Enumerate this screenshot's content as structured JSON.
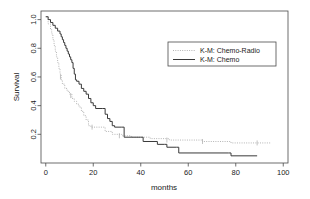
{
  "chart_data": {
    "type": "line",
    "title": "",
    "subtitle": "",
    "xlabel": "months",
    "ylabel": "Survival",
    "xlim": [
      -2,
      102
    ],
    "ylim": [
      0.0,
      1.06
    ],
    "grid": false,
    "legend_position": "upper-right",
    "xticks": [
      0,
      20,
      40,
      60,
      80,
      100
    ],
    "xtick_labels": [
      "0",
      "20",
      "40",
      "60",
      "80",
      "100"
    ],
    "yticks": [
      0.2,
      0.4,
      0.6,
      0.8,
      1.0
    ],
    "ytick_labels": [
      "0.2",
      "0.4",
      "0.6",
      "0.8",
      "1.0"
    ],
    "series": [
      {
        "name": "K-M: Chemo-Radio",
        "style": "dotted",
        "color": "#b4b4b4",
        "steps": [
          [
            0,
            1.02
          ],
          [
            1,
            0.97
          ],
          [
            2,
            0.93
          ],
          [
            2.5,
            0.9
          ],
          [
            3,
            0.86
          ],
          [
            3.5,
            0.82
          ],
          [
            4,
            0.78
          ],
          [
            4.5,
            0.74
          ],
          [
            5,
            0.7
          ],
          [
            5.5,
            0.66
          ],
          [
            6,
            0.62
          ],
          [
            6.5,
            0.58
          ],
          [
            7,
            0.55
          ],
          [
            8,
            0.52
          ],
          [
            9,
            0.5
          ],
          [
            10,
            0.48
          ],
          [
            11,
            0.45
          ],
          [
            12,
            0.43
          ],
          [
            13,
            0.41
          ],
          [
            14,
            0.39
          ],
          [
            15,
            0.36
          ],
          [
            16,
            0.33
          ],
          [
            17,
            0.3
          ],
          [
            18,
            0.26
          ],
          [
            19,
            0.25
          ],
          [
            22,
            0.25
          ],
          [
            25,
            0.22
          ],
          [
            28,
            0.2
          ],
          [
            32,
            0.19
          ],
          [
            36,
            0.18
          ],
          [
            40,
            0.18
          ],
          [
            44,
            0.17
          ],
          [
            48,
            0.17
          ],
          [
            52,
            0.16
          ],
          [
            58,
            0.16
          ],
          [
            66,
            0.15
          ],
          [
            78,
            0.14
          ],
          [
            90,
            0.14
          ],
          [
            95,
            0.14
          ]
        ],
        "censor_points": [
          [
            6.2,
            0.6
          ],
          [
            10.5,
            0.47
          ],
          [
            19.5,
            0.25
          ],
          [
            31,
            0.19
          ],
          [
            51,
            0.16
          ],
          [
            66,
            0.15
          ],
          [
            89,
            0.14
          ]
        ]
      },
      {
        "name": "K-M: Chemo",
        "style": "solid",
        "color": "#3a3a3a",
        "steps": [
          [
            0,
            1.02
          ],
          [
            1,
            1.0
          ],
          [
            2,
            0.98
          ],
          [
            3,
            0.96
          ],
          [
            4,
            0.94
          ],
          [
            5,
            0.92
          ],
          [
            6,
            0.9
          ],
          [
            6.5,
            0.88
          ],
          [
            7,
            0.86
          ],
          [
            7.5,
            0.84
          ],
          [
            8,
            0.82
          ],
          [
            8.5,
            0.8
          ],
          [
            9,
            0.78
          ],
          [
            9.5,
            0.76
          ],
          [
            10,
            0.74
          ],
          [
            10.5,
            0.72
          ],
          [
            11,
            0.7
          ],
          [
            11.5,
            0.66
          ],
          [
            12,
            0.62
          ],
          [
            12.5,
            0.58
          ],
          [
            13,
            0.57
          ],
          [
            14,
            0.55
          ],
          [
            15,
            0.52
          ],
          [
            16,
            0.5
          ],
          [
            17,
            0.48
          ],
          [
            18,
            0.45
          ],
          [
            19,
            0.42
          ],
          [
            20,
            0.4
          ],
          [
            21,
            0.38
          ],
          [
            24,
            0.38
          ],
          [
            25,
            0.34
          ],
          [
            26,
            0.31
          ],
          [
            27,
            0.29
          ],
          [
            28,
            0.26
          ],
          [
            29,
            0.25
          ],
          [
            32,
            0.25
          ],
          [
            33,
            0.18
          ],
          [
            40,
            0.18
          ],
          [
            41,
            0.15
          ],
          [
            46,
            0.15
          ],
          [
            47,
            0.13
          ],
          [
            50,
            0.13
          ],
          [
            51,
            0.11
          ],
          [
            55,
            0.11
          ],
          [
            56,
            0.07
          ],
          [
            77,
            0.07
          ],
          [
            78,
            0.05
          ],
          [
            89,
            0.05
          ]
        ],
        "censor_points": []
      }
    ]
  },
  "legend": {
    "entries": [
      {
        "label": "K-M: Chemo-Radio",
        "style": "dotted"
      },
      {
        "label": "K-M: Chemo",
        "style": "solid"
      }
    ]
  },
  "colors": {
    "background": "#ffffff",
    "axis": "#4a4a4a",
    "solid_series": "#3a3a3a",
    "dotted_series": "#b4b4b4",
    "text": "#1a1a1a"
  }
}
